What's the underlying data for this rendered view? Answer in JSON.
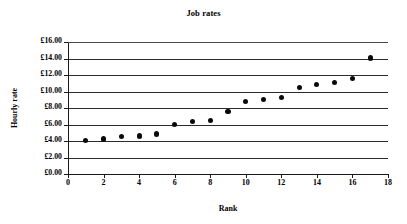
{
  "chart_data": {
    "type": "scatter",
    "title": "Job rates",
    "xlabel": "Rank",
    "ylabel": "Hourly rate",
    "xlim": [
      0,
      18
    ],
    "ylim": [
      0,
      16
    ],
    "grid": true,
    "legend": false,
    "x_ticks": [
      "0",
      "2",
      "4",
      "6",
      "8",
      "10",
      "12",
      "14",
      "16",
      "18"
    ],
    "x_tick_values": [
      0,
      2,
      4,
      6,
      8,
      10,
      12,
      14,
      16,
      18
    ],
    "y_ticks": [
      "£0.00",
      "£2.00",
      "£4.00",
      "£6.00",
      "£8.00",
      "£10.00",
      "£12.00",
      "£14.00",
      "£16.00"
    ],
    "y_tick_values": [
      0,
      2,
      4,
      6,
      8,
      10,
      12,
      14,
      16
    ],
    "currency_symbol": "£",
    "marker_color": "#0a0a0a",
    "grid_color": "#2b2b2b",
    "series": [
      {
        "name": "Hourly rate by rank",
        "x": [
          1,
          2,
          3,
          4,
          5,
          6,
          7,
          8,
          9,
          10,
          11,
          12,
          13,
          14,
          15,
          16,
          17
        ],
        "values": [
          4.1,
          4.25,
          4.5,
          4.6,
          4.85,
          6.0,
          6.35,
          6.5,
          7.55,
          8.75,
          9.0,
          9.25,
          10.5,
          10.8,
          11.05,
          11.55,
          14.05
        ]
      }
    ]
  }
}
